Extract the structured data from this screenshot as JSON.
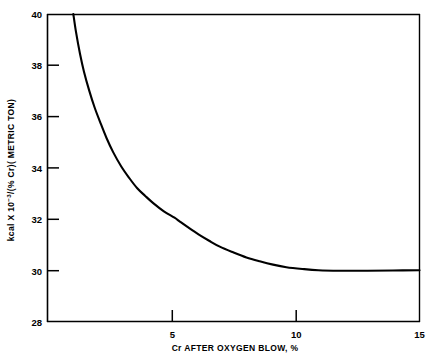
{
  "chart_data": {
    "type": "line",
    "title": "",
    "subtitle": "",
    "xlabel": "Cr AFTER OXYGEN BLOW, %",
    "ylabel": "kcal X 10-3/(% Cr)( METRIC TON)",
    "ylabel_parts": {
      "lead": "kcal X 10",
      "exponent": "−3",
      "trail": "/(% Cr)( METRIC TON)"
    },
    "xlim": [
      1.03,
      15
    ],
    "ylim": [
      28,
      40
    ],
    "grid": false,
    "legend": "none",
    "x_ticks": [
      5,
      10,
      15
    ],
    "x_tick_labels": [
      "5",
      "10",
      "15"
    ],
    "y_ticks": [
      28,
      30,
      32,
      34,
      36,
      38,
      40
    ],
    "y_tick_labels": [
      "28",
      "30",
      "32",
      "34",
      "36",
      "38",
      "40"
    ],
    "series": [
      {
        "name": "heat requirement",
        "x": [
          2.0,
          2.1,
          2.25,
          2.4,
          2.6,
          2.8,
          3.0,
          3.25,
          3.5,
          3.8,
          4.1,
          4.4,
          4.7,
          5.0,
          5.4,
          5.8,
          6.0,
          6.3,
          6.7,
          7.1,
          7.5,
          8.0,
          8.5,
          9.0,
          9.5,
          10.0,
          10.6,
          11.2,
          12.0,
          13.0,
          14.0,
          15.0
        ],
        "values": [
          40.0,
          39.3,
          38.45,
          37.75,
          37.0,
          36.35,
          35.8,
          35.15,
          34.6,
          34.05,
          33.6,
          33.2,
          32.9,
          32.62,
          32.3,
          32.05,
          31.9,
          31.68,
          31.4,
          31.15,
          30.92,
          30.7,
          30.5,
          30.35,
          30.22,
          30.12,
          30.05,
          30.0,
          29.98,
          29.98,
          29.99,
          30.0
        ]
      }
    ],
    "annotations": []
  },
  "axes": {
    "x_axis_name": "cr-after-oxygen-blow-axis",
    "y_axis_name": "kcal-per-percent-cr-axis"
  },
  "colors": {
    "curve": "#000000",
    "frame": "#000000",
    "background": "#ffffff",
    "text": "#000000"
  }
}
